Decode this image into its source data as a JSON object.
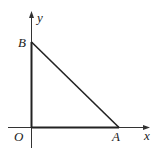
{
  "diagram": {
    "type": "coordinate-triangle",
    "axes": {
      "x_label": "x",
      "y_label": "y"
    },
    "points": {
      "O": {
        "label": "O"
      },
      "A": {
        "label": "A"
      },
      "B": {
        "label": "B"
      }
    },
    "segments": [
      "OA",
      "OB",
      "AB"
    ],
    "colors": {
      "line": "#222222",
      "axis": "#333333"
    }
  }
}
